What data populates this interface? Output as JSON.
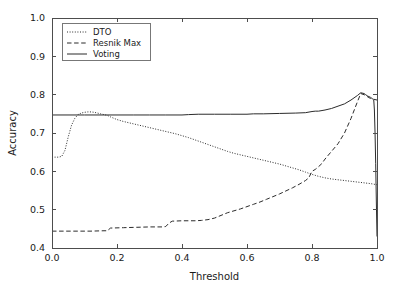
{
  "chart_data": {
    "type": "line",
    "title": "",
    "xlabel": "Threshold",
    "ylabel": "Accuracy",
    "xlim": [
      0.0,
      1.0
    ],
    "ylim": [
      0.4,
      1.0
    ],
    "xticks": [
      "0.0",
      "0.2",
      "0.4",
      "0.6",
      "0.8",
      "1.0"
    ],
    "xtick_values": [
      0.0,
      0.2,
      0.4,
      0.6,
      0.8,
      1.0
    ],
    "yticks": [
      "0.4",
      "0.5",
      "0.6",
      "0.7",
      "0.8",
      "0.9",
      "1.0"
    ],
    "ytick_values": [
      0.4,
      0.5,
      0.6,
      0.7,
      0.8,
      0.9,
      1.0
    ],
    "grid": false,
    "legend_position": "upper left",
    "series": [
      {
        "name": "DTO",
        "style": "dotted",
        "color": "#2b2b2b",
        "x": [
          0.0,
          0.01,
          0.02,
          0.03,
          0.04,
          0.05,
          0.06,
          0.07,
          0.08,
          0.09,
          0.1,
          0.11,
          0.12,
          0.13,
          0.14,
          0.15,
          0.16,
          0.17,
          0.18,
          0.2,
          0.22,
          0.24,
          0.26,
          0.28,
          0.3,
          0.32,
          0.34,
          0.36,
          0.38,
          0.4,
          0.42,
          0.44,
          0.46,
          0.48,
          0.5,
          0.52,
          0.54,
          0.56,
          0.58,
          0.6,
          0.62,
          0.64,
          0.66,
          0.68,
          0.7,
          0.72,
          0.74,
          0.76,
          0.78,
          0.8,
          0.82,
          0.84,
          0.86,
          0.88,
          0.9,
          0.92,
          0.94,
          0.96,
          0.98,
          1.0
        ],
        "y": [
          0.637,
          0.637,
          0.637,
          0.639,
          0.655,
          0.69,
          0.72,
          0.738,
          0.748,
          0.752,
          0.754,
          0.755,
          0.755,
          0.754,
          0.752,
          0.75,
          0.748,
          0.746,
          0.742,
          0.735,
          0.73,
          0.726,
          0.722,
          0.718,
          0.714,
          0.71,
          0.706,
          0.702,
          0.698,
          0.693,
          0.688,
          0.682,
          0.676,
          0.67,
          0.664,
          0.658,
          0.652,
          0.647,
          0.643,
          0.639,
          0.635,
          0.631,
          0.627,
          0.623,
          0.619,
          0.614,
          0.609,
          0.604,
          0.598,
          0.592,
          0.587,
          0.583,
          0.58,
          0.578,
          0.576,
          0.574,
          0.572,
          0.57,
          0.568,
          0.565
        ]
      },
      {
        "name": "Resnik Max",
        "style": "dashed",
        "color": "#2b2b2b",
        "x": [
          0.0,
          0.04,
          0.08,
          0.12,
          0.16,
          0.17,
          0.18,
          0.22,
          0.26,
          0.3,
          0.34,
          0.35,
          0.36,
          0.37,
          0.4,
          0.44,
          0.46,
          0.48,
          0.5,
          0.52,
          0.54,
          0.56,
          0.58,
          0.6,
          0.62,
          0.64,
          0.66,
          0.68,
          0.7,
          0.72,
          0.74,
          0.76,
          0.78,
          0.79,
          0.8,
          0.81,
          0.82,
          0.83,
          0.84,
          0.86,
          0.88,
          0.9,
          0.92,
          0.94,
          0.95,
          0.96,
          0.97,
          0.98,
          0.99,
          1.0
        ],
        "y": [
          0.444,
          0.444,
          0.444,
          0.444,
          0.445,
          0.445,
          0.452,
          0.453,
          0.454,
          0.455,
          0.455,
          0.456,
          0.465,
          0.47,
          0.471,
          0.471,
          0.472,
          0.474,
          0.478,
          0.485,
          0.492,
          0.497,
          0.502,
          0.508,
          0.514,
          0.52,
          0.527,
          0.534,
          0.541,
          0.549,
          0.557,
          0.566,
          0.576,
          0.583,
          0.6,
          0.605,
          0.612,
          0.62,
          0.632,
          0.652,
          0.672,
          0.7,
          0.738,
          0.782,
          0.803,
          0.8,
          0.795,
          0.79,
          0.788,
          0.786
        ]
      },
      {
        "name": "Voting",
        "style": "solid",
        "color": "#2b2b2b",
        "x": [
          0.0,
          0.1,
          0.2,
          0.25,
          0.3,
          0.35,
          0.4,
          0.42,
          0.45,
          0.5,
          0.55,
          0.6,
          0.62,
          0.65,
          0.7,
          0.75,
          0.78,
          0.8,
          0.81,
          0.82,
          0.84,
          0.86,
          0.88,
          0.9,
          0.92,
          0.94,
          0.95,
          0.96,
          0.965,
          0.97,
          0.975,
          0.98,
          0.985,
          0.99,
          0.992,
          0.994,
          0.996,
          0.998,
          1.0
        ],
        "y": [
          0.747,
          0.747,
          0.747,
          0.747,
          0.747,
          0.747,
          0.747,
          0.748,
          0.749,
          0.749,
          0.749,
          0.749,
          0.75,
          0.75,
          0.751,
          0.752,
          0.753,
          0.756,
          0.757,
          0.757,
          0.76,
          0.764,
          0.77,
          0.776,
          0.786,
          0.798,
          0.805,
          0.803,
          0.8,
          0.797,
          0.795,
          0.793,
          0.79,
          0.786,
          0.76,
          0.7,
          0.62,
          0.52,
          0.43
        ]
      }
    ]
  },
  "legend": {
    "entries": [
      {
        "label": "DTO",
        "style": "dotted"
      },
      {
        "label": "Resnik Max",
        "style": "dashed"
      },
      {
        "label": "Voting",
        "style": "solid"
      }
    ]
  }
}
